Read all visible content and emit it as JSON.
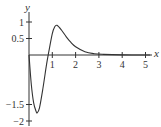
{
  "chart_data": {
    "type": "line",
    "title": "",
    "xlabel": "x",
    "ylabel": "y",
    "xlim": [
      0,
      5.3
    ],
    "ylim": [
      -2.1,
      1.4
    ],
    "grid": false,
    "x_ticks": [
      "1",
      "2",
      "3",
      "4",
      "5"
    ],
    "y_ticks": [
      "1",
      "0.5",
      "-1.5",
      "-2"
    ],
    "series": [
      {
        "name": "curve",
        "x": [
          0,
          0.1,
          0.2,
          0.3,
          0.35,
          0.45,
          0.6,
          0.75,
          0.85,
          1.0,
          1.1,
          1.2,
          1.4,
          1.6,
          1.8,
          2.0,
          2.4,
          2.8,
          3.2,
          4.0,
          5.0,
          5.2
        ],
        "y": [
          0,
          -0.9,
          -1.45,
          -1.7,
          -1.75,
          -1.6,
          -1.0,
          -0.3,
          0.1,
          0.65,
          0.85,
          0.9,
          0.75,
          0.55,
          0.38,
          0.25,
          0.1,
          0.04,
          0.02,
          0.005,
          0.0,
          0.0
        ]
      }
    ]
  }
}
